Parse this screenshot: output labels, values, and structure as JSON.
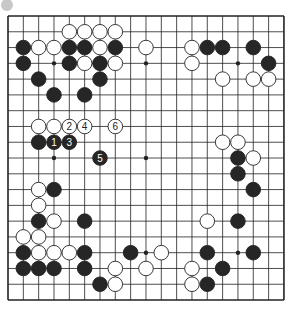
{
  "diagram": {
    "type": "go-board",
    "size": 19,
    "view": {
      "cols": 19,
      "rows": 19
    },
    "origin": {
      "x": 8,
      "y": 16
    },
    "spacing": {
      "x": 15.33,
      "y": 15.78
    },
    "colors": {
      "line": "#222222",
      "black_stone": "#262626",
      "white_stone": "#ffffff",
      "stone_outline": "#222222",
      "marker": "#c8c8c8"
    },
    "star_points": [
      [
        3,
        3
      ],
      [
        9,
        3
      ],
      [
        15,
        3
      ],
      [
        3,
        9
      ],
      [
        9,
        9
      ],
      [
        15,
        9
      ],
      [
        3,
        15
      ],
      [
        9,
        15
      ],
      [
        15,
        15
      ]
    ],
    "black_stones": [
      [
        1,
        2
      ],
      [
        4,
        2
      ],
      [
        5,
        2
      ],
      [
        7,
        2
      ],
      [
        13,
        2
      ],
      [
        14,
        2
      ],
      [
        16,
        2
      ],
      [
        1,
        3
      ],
      [
        4,
        3
      ],
      [
        6,
        3
      ],
      [
        17,
        3
      ],
      [
        2,
        4
      ],
      [
        6,
        4
      ],
      [
        3,
        5
      ],
      [
        5,
        5
      ],
      [
        2,
        8
      ],
      [
        15,
        9
      ],
      [
        15,
        10
      ],
      [
        3,
        11
      ],
      [
        16,
        11
      ],
      [
        2,
        13
      ],
      [
        5,
        13
      ],
      [
        15,
        13
      ],
      [
        1,
        15
      ],
      [
        5,
        15
      ],
      [
        8,
        15
      ],
      [
        13,
        15
      ],
      [
        16,
        15
      ],
      [
        1,
        16
      ],
      [
        2,
        16
      ],
      [
        3,
        16
      ],
      [
        5,
        16
      ],
      [
        14,
        16
      ],
      [
        6,
        17
      ],
      [
        13,
        17
      ]
    ],
    "white_stones": [
      [
        4,
        1
      ],
      [
        5,
        1
      ],
      [
        6,
        1
      ],
      [
        7,
        1
      ],
      [
        2,
        2
      ],
      [
        3,
        2
      ],
      [
        6,
        2
      ],
      [
        9,
        2
      ],
      [
        12,
        2
      ],
      [
        5,
        3
      ],
      [
        7,
        3
      ],
      [
        12,
        3
      ],
      [
        14,
        4
      ],
      [
        16,
        4
      ],
      [
        17,
        4
      ],
      [
        2,
        7
      ],
      [
        3,
        7
      ],
      [
        14,
        8
      ],
      [
        15,
        8
      ],
      [
        16,
        9
      ],
      [
        2,
        11
      ],
      [
        2,
        12
      ],
      [
        3,
        13
      ],
      [
        13,
        13
      ],
      [
        1,
        14
      ],
      [
        2,
        14
      ],
      [
        2,
        15
      ],
      [
        3,
        15
      ],
      [
        4,
        15
      ],
      [
        10,
        15
      ],
      [
        7,
        16
      ],
      [
        9,
        16
      ],
      [
        12,
        16
      ],
      [
        7,
        17
      ],
      [
        12,
        17
      ]
    ],
    "numbered_moves": [
      {
        "n": "1",
        "color": "black",
        "x": 3,
        "y": 8
      },
      {
        "n": "2",
        "color": "white",
        "x": 4,
        "y": 7
      },
      {
        "n": "3",
        "color": "black",
        "x": 4,
        "y": 8
      },
      {
        "n": "4",
        "color": "white",
        "x": 5,
        "y": 7
      },
      {
        "n": "5",
        "color": "black",
        "x": 6,
        "y": 9
      },
      {
        "n": "6",
        "color": "white",
        "x": 7,
        "y": 7
      }
    ]
  }
}
